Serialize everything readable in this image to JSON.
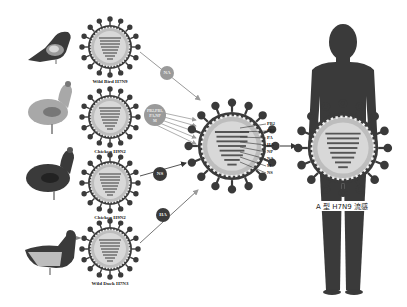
{
  "diagram": {
    "type": "virus-reassortment",
    "sources": [
      {
        "animal": "bird-icon",
        "label": "Wild Bird H7N9"
      },
      {
        "animal": "chicken-icon",
        "label": "Chicken H9N2"
      },
      {
        "animal": "hen-icon",
        "label": "Chicken H9N2"
      },
      {
        "animal": "duck-icon",
        "label": "Wild Duck H7N3"
      }
    ],
    "contributions": [
      {
        "label": "NA"
      },
      {
        "label": "PB2,PB1,\nPA,NP\nM"
      },
      {
        "label": "NS"
      },
      {
        "label": "HA"
      }
    ],
    "segments": [
      "PB2",
      "PB1",
      "PA",
      "HA",
      "NP",
      "NA",
      "M",
      "NS"
    ],
    "result_caption": "A 型 H7N9 流感"
  },
  "colors": {
    "dark": "#3a3a3a",
    "mid": "#8a8a8a",
    "light": "#d0d0d0",
    "arrow": "#9a9a9a"
  }
}
